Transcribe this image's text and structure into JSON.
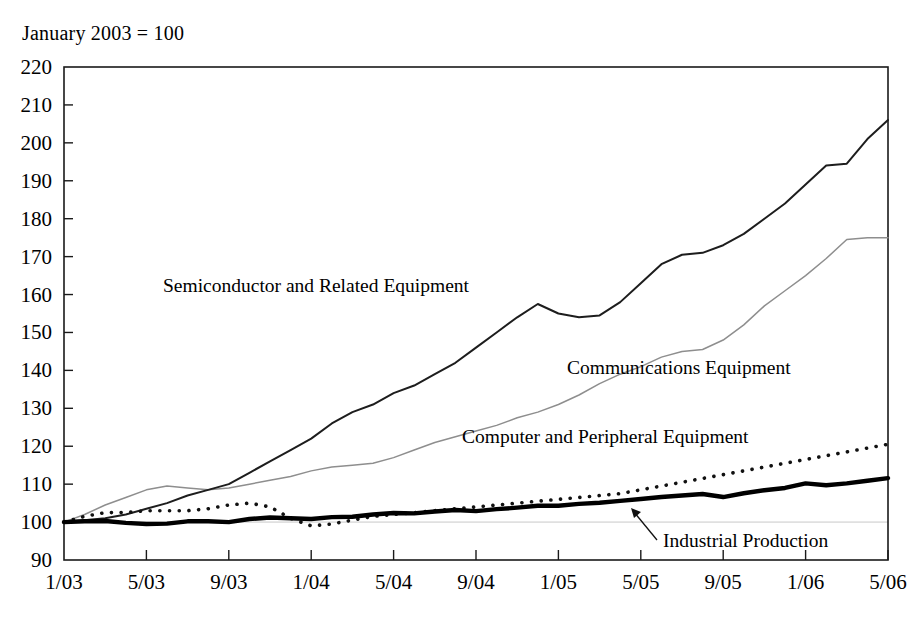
{
  "figure": {
    "note": "January 2003 = 100",
    "base_label": "January 2003 = 100"
  },
  "labels": {
    "semiconductor": "Semiconductor and Related Equipment",
    "communications": "Communications Equipment",
    "computer": "Computer and Peripheral Equipment",
    "industrial": "Industrial Production"
  },
  "colors": {
    "semiconductor": "#1d1d1d",
    "communications": "#8e8e8e",
    "computer": "#111111",
    "industrial": "#000000",
    "frame": "#1a1a1a",
    "gridline": "#c9c9c9",
    "background": "#ffffff"
  },
  "chart_data": {
    "type": "line",
    "title": "January 2003 = 100",
    "subtitle": "",
    "xlabel": "",
    "ylabel": "",
    "ylim": [
      90,
      220
    ],
    "ytick_step": 10,
    "yticks": [
      90,
      100,
      110,
      120,
      130,
      140,
      150,
      160,
      170,
      180,
      190,
      200,
      210,
      220
    ],
    "ytick_labels": [
      "90",
      "100",
      "110",
      "120",
      "130",
      "140",
      "150",
      "160",
      "170",
      "180",
      "190",
      "200",
      "210",
      "220"
    ],
    "xticks": [
      "1/03",
      "5/03",
      "9/03",
      "1/04",
      "5/04",
      "9/04",
      "1/05",
      "5/05",
      "9/05",
      "1/06",
      "5/06"
    ],
    "xtick_labels": [
      "1/03",
      "5/03",
      "9/03",
      "1/04",
      "5/04",
      "9/04",
      "1/05",
      "5/05",
      "9/05",
      "1/06",
      "5/06"
    ],
    "x": [
      "1/03",
      "2/03",
      "3/03",
      "4/03",
      "5/03",
      "6/03",
      "7/03",
      "8/03",
      "9/03",
      "10/03",
      "11/03",
      "12/03",
      "1/04",
      "2/04",
      "3/04",
      "4/04",
      "5/04",
      "6/04",
      "7/04",
      "8/04",
      "9/04",
      "10/04",
      "11/04",
      "12/04",
      "1/05",
      "2/05",
      "3/05",
      "4/05",
      "5/05",
      "6/05",
      "7/05",
      "8/05",
      "9/05",
      "10/05",
      "11/05",
      "12/05",
      "1/06",
      "2/06",
      "3/06",
      "4/06",
      "5/06"
    ],
    "grid": false,
    "grid_at": [
      100
    ],
    "legend_position": "inline-annotations",
    "series": [
      {
        "name": "Semiconductor and Related Equipment",
        "style": "solid-thin-dark",
        "values": [
          100,
          100.5,
          101,
          102,
          103.5,
          105,
          107,
          108.5,
          110,
          113,
          116,
          119,
          122,
          126,
          129,
          131,
          134,
          136,
          139,
          142,
          146,
          150,
          154,
          157.5,
          155,
          154,
          154.5,
          158,
          163,
          168,
          170.5,
          171,
          173,
          176,
          180,
          184,
          189,
          194,
          194.5,
          201,
          206
        ]
      },
      {
        "name": "Communications Equipment",
        "style": "solid-thin-gray",
        "values": [
          100,
          102,
          104.5,
          106.5,
          108.5,
          109.5,
          109,
          108.5,
          109,
          110,
          111,
          112,
          113.5,
          114.5,
          115,
          115.5,
          117,
          119,
          121,
          122.5,
          124,
          125.5,
          127.5,
          129,
          131,
          133.5,
          136.5,
          139,
          141,
          143.5,
          145,
          145.5,
          148,
          152,
          157,
          161,
          165,
          169.5,
          174.5,
          175,
          175
        ]
      },
      {
        "name": "Computer and Peripheral Equipment",
        "style": "dotted-heavy",
        "values": [
          100,
          101.5,
          102.5,
          102.5,
          103,
          103,
          103,
          103.5,
          104.5,
          105,
          104,
          101,
          99,
          99.5,
          100.5,
          101.5,
          102,
          102.5,
          103,
          103.5,
          104,
          104.5,
          105,
          105.5,
          106,
          106.5,
          107,
          107.5,
          108.5,
          109.5,
          110.5,
          111.5,
          112.5,
          113.5,
          114.5,
          115.5,
          116.5,
          117.5,
          118.5,
          119.5,
          120.5
        ]
      },
      {
        "name": "Industrial Production",
        "style": "solid-thick-black",
        "values": [
          100,
          100.2,
          100.3,
          99.8,
          99.5,
          99.6,
          100.2,
          100.2,
          100.0,
          100.8,
          101.2,
          101.0,
          100.8,
          101.3,
          101.4,
          102.0,
          102.4,
          102.3,
          102.8,
          103.2,
          102.9,
          103.4,
          103.8,
          104.3,
          104.3,
          104.8,
          105.1,
          105.6,
          106.1,
          106.6,
          107.0,
          107.4,
          106.6,
          107.6,
          108.4,
          109.0,
          110.2,
          109.7,
          110.2,
          110.9,
          111.6
        ]
      }
    ],
    "annotations": [
      {
        "text": "Semiconductor and Related Equipment",
        "series": "Semiconductor and Related Equipment"
      },
      {
        "text": "Communications Equipment",
        "series": "Communications Equipment"
      },
      {
        "text": "Computer and Peripheral Equipment",
        "series": "Computer and Peripheral Equipment"
      },
      {
        "text": "Industrial Production",
        "series": "Industrial Production",
        "has_arrow": true
      }
    ]
  }
}
